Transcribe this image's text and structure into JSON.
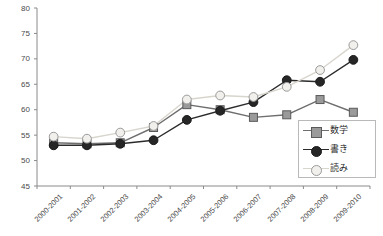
{
  "chart_data": {
    "type": "line",
    "title": "",
    "xlabel": "",
    "ylabel": "",
    "ylim": [
      45,
      80
    ],
    "yticks": [
      45,
      50,
      55,
      60,
      65,
      70,
      75,
      80
    ],
    "grid": false,
    "legend_position": "bottom-right",
    "categories": [
      "2000-2001",
      "2001-2002",
      "2002-2003",
      "2003-2004",
      "2004-2005",
      "2005-2006",
      "2006-2007",
      "2007-2008",
      "2008-2009",
      "2009-2010"
    ],
    "series": [
      {
        "name": "数学",
        "marker": "square",
        "marker_fill": "#9a9a9a",
        "marker_stroke": "#5a5a5a",
        "line_color": "#6e6e6e",
        "values": [
          53.5,
          53.3,
          53.5,
          56.5,
          61.0,
          60.0,
          58.5,
          59.0,
          62.0,
          59.5
        ]
      },
      {
        "name": "書き",
        "marker": "circle-filled",
        "marker_fill": "#262626",
        "marker_stroke": "#1a1a1a",
        "line_color": "#2b2b2b",
        "values": [
          53.0,
          53.0,
          53.3,
          54.0,
          58.0,
          59.8,
          61.5,
          65.8,
          65.5,
          69.8
        ]
      },
      {
        "name": "読み",
        "marker": "circle-open",
        "marker_fill": "#f2f0ec",
        "marker_stroke": "#9a9a9a",
        "line_color": "#d8d5cd",
        "values": [
          54.7,
          54.3,
          55.5,
          56.8,
          62.0,
          62.8,
          62.5,
          64.5,
          67.8,
          72.7
        ]
      }
    ]
  },
  "axes": {
    "y_tick_labels": [
      "80",
      "75",
      "70",
      "65",
      "60",
      "55",
      "50",
      "45"
    ]
  },
  "legend": {
    "items": [
      {
        "label": "数学"
      },
      {
        "label": "書き"
      },
      {
        "label": "読み"
      }
    ]
  }
}
